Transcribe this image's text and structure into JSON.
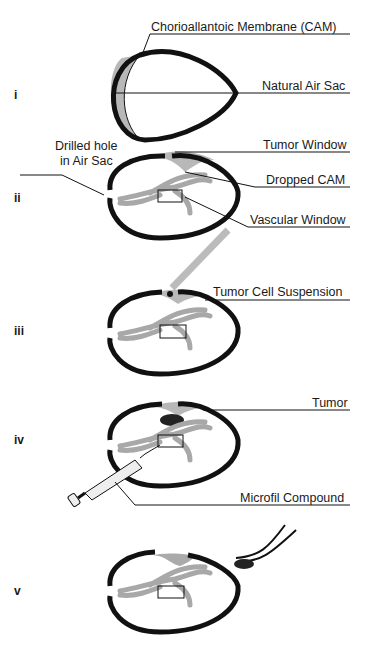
{
  "steps": [
    {
      "numeral": "i",
      "labels": [
        "Chorioallantoic Membrane (CAM)",
        "Natural Air Sac"
      ]
    },
    {
      "numeral": "ii",
      "labels": [
        "Drilled hole",
        "in Air Sac",
        "Tumor Window",
        "Dropped CAM",
        "Vascular Window"
      ]
    },
    {
      "numeral": "iii",
      "labels": [
        "Tumor Cell Suspension"
      ]
    },
    {
      "numeral": "iv",
      "labels": [
        "Tumor",
        "Microfil Compound"
      ]
    },
    {
      "numeral": "v",
      "labels": []
    }
  ],
  "colors": {
    "shell": "#111111",
    "cam": "#b8b8b8",
    "vessel": "#a8a8a8",
    "line": "#111111"
  }
}
